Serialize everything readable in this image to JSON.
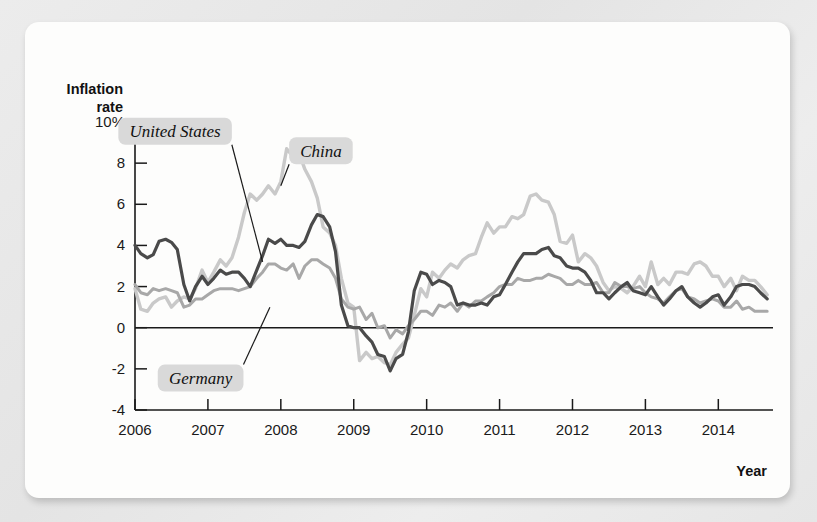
{
  "chart_data": {
    "type": "line",
    "title": "",
    "xlabel": "Year",
    "ylabel": "Inflation rate",
    "ylabel_line1": "Inflation",
    "ylabel_line2": "rate",
    "xlim": [
      2006.0,
      2014.75
    ],
    "ylim": [
      -4,
      10
    ],
    "y_ticks": [
      10,
      8,
      6,
      4,
      2,
      0,
      -2,
      -4
    ],
    "y_tick_labels": [
      "10%",
      "8",
      "6",
      "4",
      "2",
      "0",
      "-2",
      "-4"
    ],
    "x_ticks": [
      2006,
      2007,
      2008,
      2009,
      2010,
      2011,
      2012,
      2013,
      2014
    ],
    "x_tick_labels": [
      "2006",
      "2007",
      "2008",
      "2009",
      "2010",
      "2011",
      "2012",
      "2013",
      "2014"
    ],
    "grid": false,
    "legend": "inline-callout-labels",
    "zero_line": true,
    "colors": {
      "united_states": "#4a4a4a",
      "china": "#c9c9c9",
      "germany": "#a8a8a8",
      "label_background": "#d9d9d9",
      "axis": "#1a1a1a",
      "card_background": "#fdfdfc",
      "page_background": "#e9e9e9"
    },
    "annotations": [
      {
        "text": "United States",
        "series": "united_states",
        "x": 2006.55,
        "y": 9.55,
        "point_x": 2007.75,
        "point_y": 3.2
      },
      {
        "text": "China",
        "series": "china",
        "x": 2008.55,
        "y": 8.6,
        "point_x": 2008.0,
        "point_y": 6.9
      },
      {
        "text": "Germany",
        "series": "germany",
        "x": 2006.9,
        "y": -2.45,
        "point_x": 2007.85,
        "point_y": 1.0
      }
    ],
    "series": [
      {
        "name": "United States",
        "key": "united_states",
        "color": "#4a4a4a",
        "width": 3.2,
        "x": [
          2006.0,
          2006.08,
          2006.17,
          2006.25,
          2006.33,
          2006.42,
          2006.5,
          2006.58,
          2006.67,
          2006.75,
          2006.83,
          2006.92,
          2007.0,
          2007.08,
          2007.17,
          2007.25,
          2007.33,
          2007.42,
          2007.5,
          2007.58,
          2007.67,
          2007.75,
          2007.83,
          2007.92,
          2008.0,
          2008.08,
          2008.17,
          2008.25,
          2008.33,
          2008.42,
          2008.5,
          2008.58,
          2008.67,
          2008.75,
          2008.83,
          2008.92,
          2009.0,
          2009.08,
          2009.17,
          2009.25,
          2009.33,
          2009.42,
          2009.5,
          2009.58,
          2009.67,
          2009.75,
          2009.83,
          2009.92,
          2010.0,
          2010.08,
          2010.17,
          2010.25,
          2010.33,
          2010.42,
          2010.5,
          2010.58,
          2010.67,
          2010.75,
          2010.83,
          2010.92,
          2011.0,
          2011.08,
          2011.17,
          2011.25,
          2011.33,
          2011.42,
          2011.5,
          2011.58,
          2011.67,
          2011.75,
          2011.83,
          2011.92,
          2012.0,
          2012.08,
          2012.17,
          2012.25,
          2012.33,
          2012.42,
          2012.5,
          2012.58,
          2012.67,
          2012.75,
          2012.83,
          2012.92,
          2013.0,
          2013.08,
          2013.17,
          2013.25,
          2013.33,
          2013.42,
          2013.5,
          2013.58,
          2013.67,
          2013.75,
          2013.83,
          2013.92,
          2014.0,
          2014.08,
          2014.17,
          2014.25,
          2014.33,
          2014.42,
          2014.5,
          2014.58,
          2014.67
        ],
        "y": [
          4.0,
          3.6,
          3.4,
          3.55,
          4.2,
          4.3,
          4.15,
          3.8,
          2.1,
          1.3,
          2.0,
          2.5,
          2.1,
          2.4,
          2.8,
          2.6,
          2.7,
          2.7,
          2.4,
          2.0,
          2.8,
          3.5,
          4.3,
          4.1,
          4.3,
          4.0,
          4.0,
          3.9,
          4.2,
          5.0,
          5.5,
          5.4,
          4.9,
          3.7,
          1.1,
          0.1,
          0.0,
          0.0,
          -0.4,
          -0.7,
          -1.3,
          -1.4,
          -2.1,
          -1.5,
          -1.3,
          -0.2,
          1.8,
          2.7,
          2.6,
          2.1,
          2.3,
          2.2,
          2.0,
          1.1,
          1.2,
          1.1,
          1.1,
          1.2,
          1.1,
          1.5,
          1.6,
          2.1,
          2.7,
          3.2,
          3.6,
          3.6,
          3.6,
          3.8,
          3.9,
          3.5,
          3.4,
          3.0,
          2.9,
          2.9,
          2.7,
          2.3,
          1.7,
          1.7,
          1.4,
          1.7,
          2.0,
          2.2,
          1.8,
          1.7,
          1.6,
          2.0,
          1.5,
          1.1,
          1.4,
          1.8,
          2.0,
          1.5,
          1.2,
          1.0,
          1.2,
          1.5,
          1.6,
          1.1,
          1.5,
          2.0,
          2.1,
          2.1,
          2.0,
          1.7,
          1.4
        ]
      },
      {
        "name": "China",
        "key": "china",
        "color": "#c9c9c9",
        "width": 3.4,
        "x": [
          2006.0,
          2006.08,
          2006.17,
          2006.25,
          2006.33,
          2006.42,
          2006.5,
          2006.58,
          2006.67,
          2006.75,
          2006.83,
          2006.92,
          2007.0,
          2007.08,
          2007.17,
          2007.25,
          2007.33,
          2007.42,
          2007.5,
          2007.58,
          2007.67,
          2007.75,
          2007.83,
          2007.92,
          2008.0,
          2008.08,
          2008.17,
          2008.25,
          2008.33,
          2008.42,
          2008.5,
          2008.58,
          2008.67,
          2008.75,
          2008.83,
          2008.92,
          2009.0,
          2009.08,
          2009.17,
          2009.25,
          2009.33,
          2009.42,
          2009.5,
          2009.58,
          2009.67,
          2009.75,
          2009.83,
          2009.92,
          2010.0,
          2010.08,
          2010.17,
          2010.25,
          2010.33,
          2010.42,
          2010.5,
          2010.58,
          2010.67,
          2010.75,
          2010.83,
          2010.92,
          2011.0,
          2011.08,
          2011.17,
          2011.25,
          2011.33,
          2011.42,
          2011.5,
          2011.58,
          2011.67,
          2011.75,
          2011.83,
          2011.92,
          2012.0,
          2012.08,
          2012.17,
          2012.25,
          2012.33,
          2012.42,
          2012.5,
          2012.58,
          2012.67,
          2012.75,
          2012.83,
          2012.92,
          2013.0,
          2013.08,
          2013.17,
          2013.25,
          2013.33,
          2013.42,
          2013.5,
          2013.58,
          2013.67,
          2013.75,
          2013.83,
          2013.92,
          2014.0,
          2014.08,
          2014.17,
          2014.25,
          2014.33,
          2014.42,
          2014.5,
          2014.58,
          2014.67
        ],
        "y": [
          1.9,
          0.9,
          0.8,
          1.2,
          1.4,
          1.5,
          1.0,
          1.3,
          1.5,
          1.4,
          1.9,
          2.8,
          2.2,
          2.7,
          3.3,
          3.0,
          3.4,
          4.4,
          5.6,
          6.5,
          6.2,
          6.5,
          6.9,
          6.5,
          7.1,
          8.7,
          8.3,
          8.5,
          7.7,
          7.1,
          6.3,
          4.9,
          4.6,
          4.0,
          2.4,
          1.2,
          1.0,
          -1.6,
          -1.2,
          -1.5,
          -1.4,
          -1.7,
          -1.8,
          -1.2,
          -0.8,
          -0.5,
          0.6,
          1.9,
          1.5,
          2.7,
          2.4,
          2.8,
          3.1,
          2.9,
          3.3,
          3.5,
          3.6,
          4.4,
          5.1,
          4.6,
          4.9,
          4.9,
          5.4,
          5.3,
          5.5,
          6.4,
          6.5,
          6.2,
          6.1,
          5.5,
          4.2,
          4.1,
          4.5,
          3.2,
          3.6,
          3.4,
          3.0,
          2.2,
          1.8,
          2.0,
          1.9,
          1.7,
          2.0,
          2.5,
          2.0,
          3.2,
          2.1,
          2.4,
          2.1,
          2.7,
          2.7,
          2.6,
          3.1,
          3.2,
          3.0,
          2.5,
          2.5,
          2.0,
          2.4,
          1.8,
          2.5,
          2.3,
          2.3,
          2.0,
          1.6
        ]
      },
      {
        "name": "Germany",
        "key": "germany",
        "color": "#a8a8a8",
        "width": 3.0,
        "x": [
          2006.0,
          2006.08,
          2006.17,
          2006.25,
          2006.33,
          2006.42,
          2006.5,
          2006.58,
          2006.67,
          2006.75,
          2006.83,
          2006.92,
          2007.0,
          2007.08,
          2007.17,
          2007.25,
          2007.33,
          2007.42,
          2007.5,
          2007.58,
          2007.67,
          2007.75,
          2007.83,
          2007.92,
          2008.0,
          2008.08,
          2008.17,
          2008.25,
          2008.33,
          2008.42,
          2008.5,
          2008.58,
          2008.67,
          2008.75,
          2008.83,
          2008.92,
          2009.0,
          2009.08,
          2009.17,
          2009.25,
          2009.33,
          2009.42,
          2009.5,
          2009.58,
          2009.67,
          2009.75,
          2009.83,
          2009.92,
          2010.0,
          2010.08,
          2010.17,
          2010.25,
          2010.33,
          2010.42,
          2010.5,
          2010.58,
          2010.67,
          2010.75,
          2010.83,
          2010.92,
          2011.0,
          2011.08,
          2011.17,
          2011.25,
          2011.33,
          2011.42,
          2011.5,
          2011.58,
          2011.67,
          2011.75,
          2011.83,
          2011.92,
          2012.0,
          2012.08,
          2012.17,
          2012.25,
          2012.33,
          2012.42,
          2012.5,
          2012.58,
          2012.67,
          2012.75,
          2012.83,
          2012.92,
          2013.0,
          2013.08,
          2013.17,
          2013.25,
          2013.33,
          2013.42,
          2013.5,
          2013.58,
          2013.67,
          2013.75,
          2013.83,
          2013.92,
          2014.0,
          2014.08,
          2014.17,
          2014.25,
          2014.33,
          2014.42,
          2014.5,
          2014.58,
          2014.67
        ],
        "y": [
          2.1,
          1.7,
          1.6,
          1.9,
          1.8,
          1.9,
          1.8,
          1.7,
          1.0,
          1.1,
          1.4,
          1.4,
          1.6,
          1.8,
          1.9,
          1.9,
          1.9,
          1.8,
          1.9,
          2.0,
          2.4,
          2.7,
          3.1,
          3.1,
          2.9,
          2.8,
          3.1,
          2.4,
          3.0,
          3.3,
          3.3,
          3.1,
          2.9,
          2.4,
          1.4,
          1.0,
          0.9,
          1.0,
          0.4,
          0.7,
          0.0,
          0.1,
          -0.5,
          -0.1,
          -0.3,
          0.1,
          0.4,
          0.8,
          0.8,
          0.6,
          1.1,
          1.0,
          1.2,
          0.8,
          1.2,
          1.0,
          1.3,
          1.3,
          1.5,
          1.7,
          2.0,
          2.1,
          2.1,
          2.4,
          2.3,
          2.3,
          2.4,
          2.4,
          2.6,
          2.5,
          2.4,
          2.1,
          2.1,
          2.3,
          2.1,
          2.1,
          2.2,
          1.7,
          1.7,
          2.2,
          2.0,
          2.0,
          1.9,
          2.0,
          1.7,
          1.5,
          1.4,
          1.2,
          1.5,
          1.8,
          1.9,
          1.5,
          1.4,
          1.2,
          1.3,
          1.4,
          1.3,
          1.0,
          1.0,
          1.3,
          0.9,
          1.0,
          0.8,
          0.8,
          0.8
        ]
      }
    ]
  }
}
